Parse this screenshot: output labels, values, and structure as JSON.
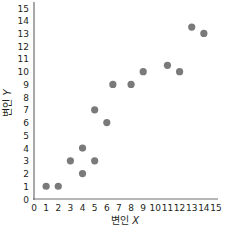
{
  "chart_data": {
    "type": "scatter",
    "title": "",
    "xlabel": "변인 X",
    "ylabel": "변인 Y",
    "xlabel_prefix": "변인",
    "xlabel_var": "X",
    "ylabel_prefix": "변인",
    "ylabel_var": "Y",
    "xlim": [
      0,
      15
    ],
    "ylim": [
      0,
      15
    ],
    "grid": false,
    "legend": null,
    "x_ticks": [
      0,
      1,
      2,
      3,
      4,
      5,
      6,
      7,
      8,
      9,
      10,
      11,
      12,
      13,
      14,
      15
    ],
    "y_ticks": [
      0,
      1,
      2,
      3,
      4,
      5,
      6,
      7,
      8,
      9,
      10,
      11,
      12,
      13,
      14,
      15
    ],
    "point_color": "#7a7a7a",
    "axis_color": "#6d6e71",
    "points": [
      {
        "x": 1,
        "y": 1
      },
      {
        "x": 2,
        "y": 1
      },
      {
        "x": 3,
        "y": 3
      },
      {
        "x": 4,
        "y": 2
      },
      {
        "x": 4,
        "y": 4
      },
      {
        "x": 5,
        "y": 3
      },
      {
        "x": 5,
        "y": 7
      },
      {
        "x": 6,
        "y": 6
      },
      {
        "x": 6.5,
        "y": 9
      },
      {
        "x": 8,
        "y": 9
      },
      {
        "x": 9,
        "y": 10
      },
      {
        "x": 11,
        "y": 10.5
      },
      {
        "x": 12,
        "y": 10
      },
      {
        "x": 13,
        "y": 13.5
      },
      {
        "x": 14,
        "y": 13
      }
    ]
  }
}
